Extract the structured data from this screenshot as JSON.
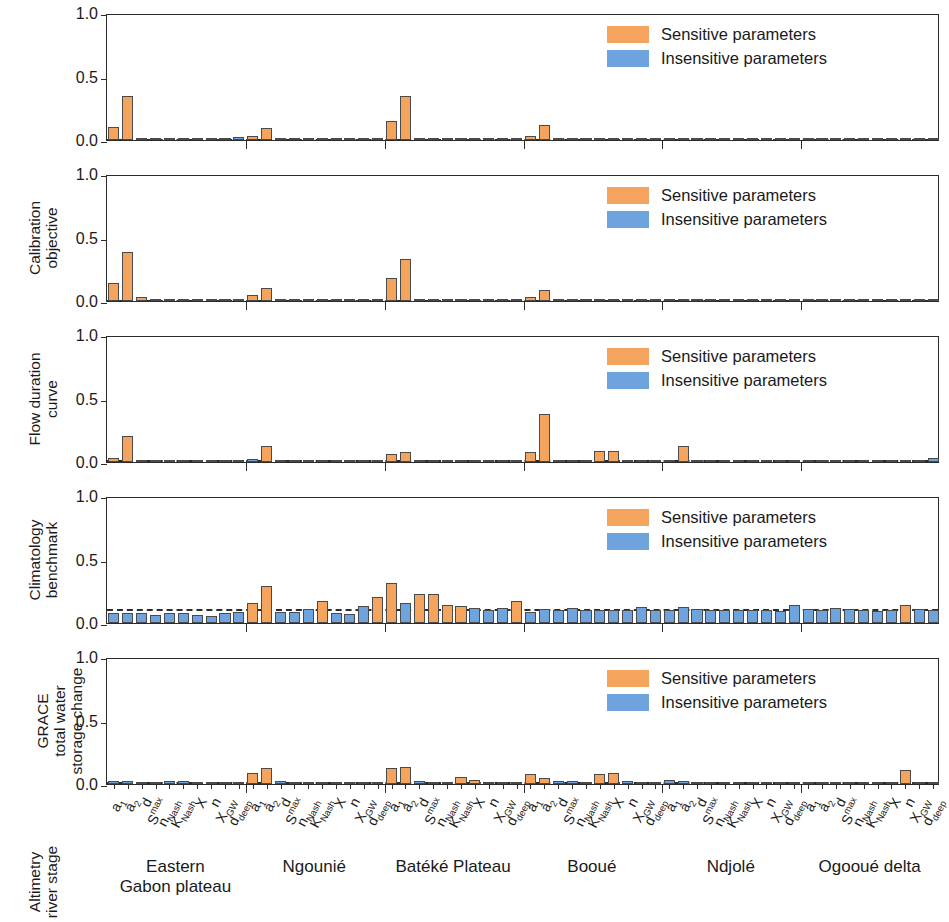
{
  "figure": {
    "colors": {
      "sensitive": "#f4a45c",
      "insensitive": "#6fa3dd",
      "bar_edge": "#4a4a4a",
      "axis": "#2b2b2b",
      "benchmark_line": "#2b2b2b"
    },
    "y_ticks": [
      "0.0",
      "0.5",
      "1.0"
    ],
    "ylim": [
      0,
      1
    ],
    "legend": {
      "sensitive_label": "Sensitive parameters",
      "insensitive_label": "Insensitive parameters"
    },
    "parameters": [
      {
        "base": "a",
        "sub": "1",
        "sup": ""
      },
      {
        "base": "a",
        "sub": "2",
        "sup": ""
      },
      {
        "base": "d",
        "sub": "",
        "sup": ""
      },
      {
        "base": "S",
        "sub": "",
        "sup": "max"
      },
      {
        "base": "n",
        "sub": "Nash",
        "sup": ""
      },
      {
        "base": "K",
        "sub": "Nash",
        "sup": ""
      },
      {
        "base": "X",
        "sub": "",
        "sup": ""
      },
      {
        "base": "n",
        "sub": "",
        "sup": ""
      },
      {
        "base": "X",
        "sub": "GW",
        "sup": ""
      },
      {
        "base": "d",
        "sub": "deep",
        "sup": ""
      }
    ],
    "groups": [
      "Eastern\nGabon plateau",
      "Ngounié",
      "Batéké Plateau",
      "Booué",
      "Ndjolé",
      "Ogooué delta"
    ]
  },
  "chart_data": {
    "type": "bar",
    "title": "",
    "xlabel": "",
    "ylabel": "",
    "ylim": [
      0,
      1
    ],
    "grid": false,
    "legend_position": "top-right",
    "categories": [
      "Eastern Gabon plateau - a1",
      "Eastern Gabon plateau - a2",
      "Eastern Gabon plateau - d",
      "Eastern Gabon plateau - Smax",
      "Eastern Gabon plateau - nNash",
      "Eastern Gabon plateau - KNash",
      "Eastern Gabon plateau - X",
      "Eastern Gabon plateau - n",
      "Eastern Gabon plateau - XGW",
      "Eastern Gabon plateau - ddeep",
      "Ngounié - a1",
      "Ngounié - a2",
      "Ngounié - d",
      "Ngounié - Smax",
      "Ngounié - nNash",
      "Ngounié - KNash",
      "Ngounié - X",
      "Ngounié - n",
      "Ngounié - XGW",
      "Ngounié - ddeep",
      "Batéké Plateau - a1",
      "Batéké Plateau - a2",
      "Batéké Plateau - d",
      "Batéké Plateau - Smax",
      "Batéké Plateau - nNash",
      "Batéké Plateau - KNash",
      "Batéké Plateau - X",
      "Batéké Plateau - n",
      "Batéké Plateau - XGW",
      "Batéké Plateau - ddeep",
      "Booué - a1",
      "Booué - a2",
      "Booué - d",
      "Booué - Smax",
      "Booué - nNash",
      "Booué - KNash",
      "Booué - X",
      "Booué - n",
      "Booué - XGW",
      "Booué - ddeep",
      "Ndjolé - a1",
      "Ndjolé - a2",
      "Ndjolé - d",
      "Ndjolé - Smax",
      "Ndjolé - nNash",
      "Ndjolé - KNash",
      "Ndjolé - X",
      "Ndjolé - n",
      "Ndjolé - XGW",
      "Ndjolé - ddeep",
      "Ogooué delta - a1",
      "Ogooué delta - a2",
      "Ogooué delta - d",
      "Ogooué delta - Smax",
      "Ogooué delta - nNash",
      "Ogooué delta - KNash",
      "Ogooué delta - X",
      "Ogooué delta - n",
      "Ogooué delta - XGW",
      "Ogooué delta - ddeep"
    ],
    "panels": [
      {
        "ylabel": "Calibration\nobjective",
        "benchmark": 0.02,
        "values": [
          0.1,
          0.35,
          0.015,
          0.012,
          0.01,
          0.01,
          0.01,
          0.012,
          0.01,
          0.022,
          0.035,
          0.095,
          0.012,
          0.01,
          0.01,
          0.012,
          0.01,
          0.01,
          0.01,
          0.01,
          0.15,
          0.345,
          0.012,
          0.01,
          0.01,
          0.012,
          0.01,
          0.01,
          0.01,
          0.01,
          0.035,
          0.115,
          0.012,
          0.01,
          0.01,
          0.01,
          0.01,
          0.01,
          0.01,
          0.01,
          0.012,
          0.012,
          0.01,
          0.01,
          0.01,
          0.012,
          0.01,
          0.01,
          0.01,
          0.01,
          0.012,
          0.015,
          0.01,
          0.01,
          0.01,
          0.012,
          0.01,
          0.01,
          0.01,
          0.012
        ],
        "sensitive": [
          true,
          true,
          false,
          false,
          false,
          false,
          false,
          false,
          false,
          false,
          true,
          true,
          false,
          false,
          false,
          false,
          false,
          false,
          false,
          false,
          true,
          true,
          false,
          false,
          false,
          false,
          false,
          false,
          false,
          false,
          true,
          true,
          false,
          false,
          false,
          false,
          false,
          false,
          false,
          false,
          false,
          false,
          false,
          false,
          false,
          false,
          false,
          false,
          false,
          false,
          false,
          false,
          false,
          false,
          false,
          false,
          false,
          false,
          false,
          false
        ]
      },
      {
        "ylabel": "Flow duration\ncurve",
        "benchmark": 0.025,
        "values": [
          0.145,
          0.385,
          0.03,
          0.012,
          0.01,
          0.012,
          0.01,
          0.012,
          0.01,
          0.012,
          0.05,
          0.1,
          0.012,
          0.01,
          0.01,
          0.012,
          0.01,
          0.01,
          0.01,
          0.01,
          0.185,
          0.33,
          0.015,
          0.01,
          0.01,
          0.012,
          0.01,
          0.01,
          0.01,
          0.01,
          0.035,
          0.09,
          0.012,
          0.01,
          0.01,
          0.01,
          0.01,
          0.01,
          0.01,
          0.01,
          0.01,
          0.012,
          0.01,
          0.01,
          0.01,
          0.01,
          0.01,
          0.01,
          0.01,
          0.01,
          0.01,
          0.012,
          0.01,
          0.01,
          0.01,
          0.01,
          0.01,
          0.01,
          0.01,
          0.012
        ],
        "sensitive": [
          true,
          true,
          true,
          false,
          false,
          false,
          false,
          false,
          false,
          false,
          true,
          true,
          false,
          false,
          false,
          false,
          false,
          false,
          false,
          false,
          true,
          true,
          false,
          false,
          false,
          false,
          false,
          false,
          false,
          false,
          true,
          true,
          false,
          false,
          false,
          false,
          false,
          false,
          false,
          false,
          false,
          false,
          false,
          false,
          false,
          false,
          false,
          false,
          false,
          false,
          false,
          false,
          false,
          false,
          false,
          false,
          false,
          false,
          false,
          false
        ]
      },
      {
        "ylabel": "Climatology\nbenchmark",
        "benchmark": 0.03,
        "values": [
          0.035,
          0.205,
          0.018,
          0.015,
          0.018,
          0.018,
          0.015,
          0.018,
          0.015,
          0.018,
          0.02,
          0.125,
          0.015,
          0.018,
          0.015,
          0.018,
          0.015,
          0.018,
          0.015,
          0.015,
          0.06,
          0.075,
          0.015,
          0.015,
          0.018,
          0.015,
          0.015,
          0.015,
          0.015,
          0.015,
          0.08,
          0.375,
          0.018,
          0.018,
          0.018,
          0.085,
          0.09,
          0.018,
          0.015,
          0.015,
          0.018,
          0.125,
          0.015,
          0.018,
          0.015,
          0.015,
          0.015,
          0.015,
          0.015,
          0.015,
          0.015,
          0.018,
          0.015,
          0.015,
          0.015,
          0.018,
          0.015,
          0.015,
          0.015,
          0.03
        ],
        "sensitive": [
          true,
          true,
          false,
          false,
          false,
          false,
          false,
          false,
          false,
          false,
          false,
          true,
          false,
          false,
          false,
          false,
          false,
          false,
          false,
          false,
          true,
          true,
          false,
          false,
          false,
          false,
          false,
          false,
          false,
          false,
          true,
          true,
          false,
          false,
          false,
          true,
          true,
          false,
          false,
          false,
          false,
          true,
          false,
          false,
          false,
          false,
          false,
          false,
          false,
          false,
          false,
          false,
          false,
          false,
          false,
          false,
          false,
          false,
          false,
          false
        ]
      },
      {
        "ylabel": "GRACE\ntotal water\nstorage change",
        "benchmark": 0.125,
        "values": [
          0.075,
          0.075,
          0.08,
          0.065,
          0.075,
          0.075,
          0.065,
          0.055,
          0.075,
          0.09,
          0.155,
          0.29,
          0.085,
          0.085,
          0.11,
          0.17,
          0.075,
          0.07,
          0.135,
          0.205,
          0.315,
          0.155,
          0.23,
          0.23,
          0.145,
          0.135,
          0.12,
          0.1,
          0.12,
          0.17,
          0.09,
          0.11,
          0.105,
          0.115,
          0.105,
          0.1,
          0.1,
          0.1,
          0.125,
          0.105,
          0.105,
          0.125,
          0.11,
          0.105,
          0.105,
          0.1,
          0.105,
          0.105,
          0.095,
          0.14,
          0.11,
          0.105,
          0.115,
          0.11,
          0.105,
          0.095,
          0.1,
          0.145,
          0.11,
          0.105
        ],
        "sensitive": [
          false,
          false,
          false,
          false,
          false,
          false,
          false,
          false,
          false,
          false,
          true,
          true,
          false,
          false,
          false,
          true,
          false,
          false,
          false,
          true,
          true,
          false,
          true,
          true,
          true,
          true,
          false,
          false,
          false,
          true,
          false,
          false,
          false,
          false,
          false,
          false,
          false,
          false,
          false,
          false,
          false,
          false,
          false,
          false,
          false,
          false,
          false,
          false,
          false,
          false,
          false,
          false,
          false,
          false,
          false,
          false,
          false,
          true,
          false,
          false
        ]
      },
      {
        "ylabel": "Altimetry\nriver stage",
        "benchmark": 0.03,
        "values": [
          0.02,
          0.022,
          0.015,
          0.012,
          0.022,
          0.022,
          0.012,
          0.015,
          0.012,
          0.012,
          0.09,
          0.125,
          0.022,
          0.018,
          0.018,
          0.018,
          0.015,
          0.015,
          0.015,
          0.012,
          0.13,
          0.135,
          0.022,
          0.018,
          0.018,
          0.055,
          0.03,
          0.015,
          0.015,
          0.018,
          0.075,
          0.045,
          0.022,
          0.022,
          0.018,
          0.08,
          0.09,
          0.022,
          0.018,
          0.018,
          0.03,
          0.022,
          0.018,
          0.018,
          0.018,
          0.018,
          0.018,
          0.018,
          0.015,
          0.018,
          0.018,
          0.018,
          0.018,
          0.018,
          0.018,
          0.018,
          0.018,
          0.11,
          0.018,
          0.018
        ],
        "sensitive": [
          false,
          false,
          false,
          false,
          false,
          false,
          false,
          false,
          false,
          false,
          true,
          true,
          false,
          false,
          false,
          false,
          false,
          false,
          false,
          false,
          true,
          true,
          false,
          false,
          false,
          true,
          true,
          false,
          false,
          false,
          true,
          true,
          false,
          false,
          false,
          true,
          true,
          false,
          false,
          false,
          false,
          false,
          false,
          false,
          false,
          false,
          false,
          false,
          false,
          false,
          false,
          false,
          false,
          false,
          false,
          false,
          false,
          true,
          false,
          false
        ]
      }
    ]
  }
}
